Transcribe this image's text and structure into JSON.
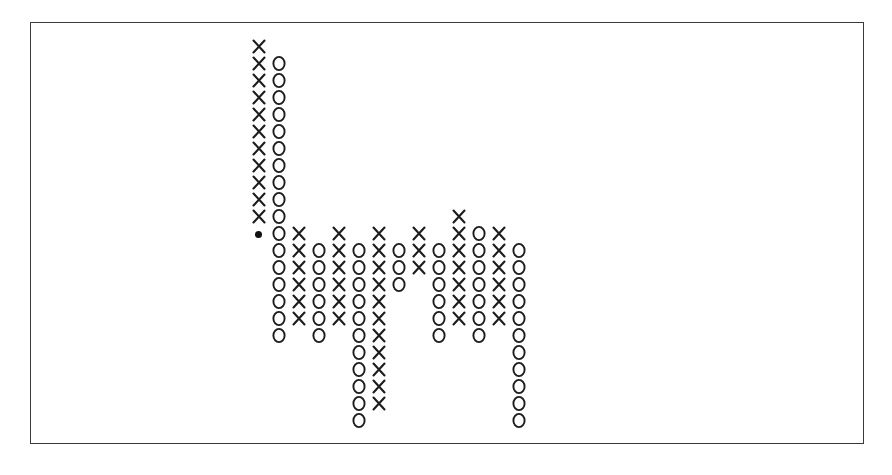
{
  "chart_data": {
    "type": "scatter",
    "title": "",
    "subtitle": "",
    "xlabel": "",
    "ylabel": "",
    "legend": [],
    "grid": false,
    "notation": "point-and-figure",
    "symbols": {
      "up": "X",
      "down": "O",
      "marker": "dot"
    },
    "colors": {
      "symbol": "#1c1c1c",
      "marker": "#111111",
      "frame": "#3a3a3a",
      "background": "#ffffff"
    },
    "geometry": {
      "origin_x": 248,
      "origin_y": 20,
      "col_pitch": 20,
      "row_pitch": 17,
      "columns": 13,
      "rows": 24
    },
    "columns": [
      {
        "index": 0,
        "symbol": "X",
        "top_row": 1,
        "bottom_row": 11,
        "count": 11
      },
      {
        "index": 1,
        "symbol": "O",
        "top_row": 2,
        "bottom_row": 18,
        "count": 17
      },
      {
        "index": 2,
        "symbol": "X",
        "top_row": 12,
        "bottom_row": 17,
        "count": 6
      },
      {
        "index": 3,
        "symbol": "O",
        "top_row": 13,
        "bottom_row": 18,
        "count": 6
      },
      {
        "index": 4,
        "symbol": "X",
        "top_row": 12,
        "bottom_row": 17,
        "count": 6
      },
      {
        "index": 5,
        "symbol": "O",
        "top_row": 13,
        "bottom_row": 23,
        "count": 11
      },
      {
        "index": 6,
        "symbol": "X",
        "top_row": 12,
        "bottom_row": 22,
        "count": 11
      },
      {
        "index": 7,
        "symbol": "O",
        "top_row": 13,
        "bottom_row": 15,
        "count": 3
      },
      {
        "index": 8,
        "symbol": "X",
        "top_row": 12,
        "bottom_row": 14,
        "count": 3
      },
      {
        "index": 9,
        "symbol": "O",
        "top_row": 13,
        "bottom_row": 18,
        "count": 6
      },
      {
        "index": 10,
        "symbol": "X",
        "top_row": 11,
        "bottom_row": 17,
        "count": 7
      },
      {
        "index": 11,
        "symbol": "O",
        "top_row": 12,
        "bottom_row": 18,
        "count": 7
      },
      {
        "index": 12,
        "symbol": "X",
        "top_row": 12,
        "bottom_row": 17,
        "count": 6
      },
      {
        "index": 13,
        "symbol": "O",
        "top_row": 13,
        "bottom_row": 23,
        "count": 11
      }
    ],
    "markers": [
      {
        "label": "dot",
        "column": 0,
        "row": 12,
        "symbol": "●"
      }
    ],
    "cells": [
      {
        "c": 0,
        "r": 1,
        "s": "X"
      },
      {
        "c": 0,
        "r": 2,
        "s": "X"
      },
      {
        "c": 0,
        "r": 3,
        "s": "X"
      },
      {
        "c": 0,
        "r": 4,
        "s": "X"
      },
      {
        "c": 0,
        "r": 5,
        "s": "X"
      },
      {
        "c": 0,
        "r": 6,
        "s": "X"
      },
      {
        "c": 0,
        "r": 7,
        "s": "X"
      },
      {
        "c": 0,
        "r": 8,
        "s": "X"
      },
      {
        "c": 0,
        "r": 9,
        "s": "X"
      },
      {
        "c": 0,
        "r": 10,
        "s": "X"
      },
      {
        "c": 0,
        "r": 11,
        "s": "X"
      },
      {
        "c": 0,
        "r": 12,
        "s": "DOT"
      },
      {
        "c": 1,
        "r": 2,
        "s": "O"
      },
      {
        "c": 1,
        "r": 3,
        "s": "O"
      },
      {
        "c": 1,
        "r": 4,
        "s": "O"
      },
      {
        "c": 1,
        "r": 5,
        "s": "O"
      },
      {
        "c": 1,
        "r": 6,
        "s": "O"
      },
      {
        "c": 1,
        "r": 7,
        "s": "O"
      },
      {
        "c": 1,
        "r": 8,
        "s": "O"
      },
      {
        "c": 1,
        "r": 9,
        "s": "O"
      },
      {
        "c": 1,
        "r": 10,
        "s": "O"
      },
      {
        "c": 1,
        "r": 11,
        "s": "O"
      },
      {
        "c": 1,
        "r": 12,
        "s": "O"
      },
      {
        "c": 1,
        "r": 13,
        "s": "O"
      },
      {
        "c": 1,
        "r": 14,
        "s": "O"
      },
      {
        "c": 1,
        "r": 15,
        "s": "O"
      },
      {
        "c": 1,
        "r": 16,
        "s": "O"
      },
      {
        "c": 1,
        "r": 17,
        "s": "O"
      },
      {
        "c": 1,
        "r": 18,
        "s": "O"
      },
      {
        "c": 2,
        "r": 12,
        "s": "X"
      },
      {
        "c": 2,
        "r": 13,
        "s": "X"
      },
      {
        "c": 2,
        "r": 14,
        "s": "X"
      },
      {
        "c": 2,
        "r": 15,
        "s": "X"
      },
      {
        "c": 2,
        "r": 16,
        "s": "X"
      },
      {
        "c": 2,
        "r": 17,
        "s": "X"
      },
      {
        "c": 3,
        "r": 13,
        "s": "O"
      },
      {
        "c": 3,
        "r": 14,
        "s": "O"
      },
      {
        "c": 3,
        "r": 15,
        "s": "O"
      },
      {
        "c": 3,
        "r": 16,
        "s": "O"
      },
      {
        "c": 3,
        "r": 17,
        "s": "O"
      },
      {
        "c": 3,
        "r": 18,
        "s": "O"
      },
      {
        "c": 4,
        "r": 12,
        "s": "X"
      },
      {
        "c": 4,
        "r": 13,
        "s": "X"
      },
      {
        "c": 4,
        "r": 14,
        "s": "X"
      },
      {
        "c": 4,
        "r": 15,
        "s": "X"
      },
      {
        "c": 4,
        "r": 16,
        "s": "X"
      },
      {
        "c": 4,
        "r": 17,
        "s": "X"
      },
      {
        "c": 5,
        "r": 13,
        "s": "O"
      },
      {
        "c": 5,
        "r": 14,
        "s": "O"
      },
      {
        "c": 5,
        "r": 15,
        "s": "O"
      },
      {
        "c": 5,
        "r": 16,
        "s": "O"
      },
      {
        "c": 5,
        "r": 17,
        "s": "O"
      },
      {
        "c": 5,
        "r": 18,
        "s": "O"
      },
      {
        "c": 5,
        "r": 19,
        "s": "O"
      },
      {
        "c": 5,
        "r": 20,
        "s": "O"
      },
      {
        "c": 5,
        "r": 21,
        "s": "O"
      },
      {
        "c": 5,
        "r": 22,
        "s": "O"
      },
      {
        "c": 5,
        "r": 23,
        "s": "O"
      },
      {
        "c": 6,
        "r": 12,
        "s": "X"
      },
      {
        "c": 6,
        "r": 13,
        "s": "X"
      },
      {
        "c": 6,
        "r": 14,
        "s": "X"
      },
      {
        "c": 6,
        "r": 15,
        "s": "X"
      },
      {
        "c": 6,
        "r": 16,
        "s": "X"
      },
      {
        "c": 6,
        "r": 17,
        "s": "X"
      },
      {
        "c": 6,
        "r": 18,
        "s": "X"
      },
      {
        "c": 6,
        "r": 19,
        "s": "X"
      },
      {
        "c": 6,
        "r": 20,
        "s": "X"
      },
      {
        "c": 6,
        "r": 21,
        "s": "X"
      },
      {
        "c": 6,
        "r": 22,
        "s": "X"
      },
      {
        "c": 7,
        "r": 13,
        "s": "O"
      },
      {
        "c": 7,
        "r": 14,
        "s": "O"
      },
      {
        "c": 7,
        "r": 15,
        "s": "O"
      },
      {
        "c": 8,
        "r": 12,
        "s": "X"
      },
      {
        "c": 8,
        "r": 13,
        "s": "X"
      },
      {
        "c": 8,
        "r": 14,
        "s": "X"
      },
      {
        "c": 9,
        "r": 13,
        "s": "O"
      },
      {
        "c": 9,
        "r": 14,
        "s": "O"
      },
      {
        "c": 9,
        "r": 15,
        "s": "O"
      },
      {
        "c": 9,
        "r": 16,
        "s": "O"
      },
      {
        "c": 9,
        "r": 17,
        "s": "O"
      },
      {
        "c": 9,
        "r": 18,
        "s": "O"
      },
      {
        "c": 10,
        "r": 11,
        "s": "X"
      },
      {
        "c": 10,
        "r": 12,
        "s": "X"
      },
      {
        "c": 10,
        "r": 13,
        "s": "X"
      },
      {
        "c": 10,
        "r": 14,
        "s": "X"
      },
      {
        "c": 10,
        "r": 15,
        "s": "X"
      },
      {
        "c": 10,
        "r": 16,
        "s": "X"
      },
      {
        "c": 10,
        "r": 17,
        "s": "X"
      },
      {
        "c": 11,
        "r": 12,
        "s": "O"
      },
      {
        "c": 11,
        "r": 13,
        "s": "O"
      },
      {
        "c": 11,
        "r": 14,
        "s": "O"
      },
      {
        "c": 11,
        "r": 15,
        "s": "O"
      },
      {
        "c": 11,
        "r": 16,
        "s": "O"
      },
      {
        "c": 11,
        "r": 17,
        "s": "O"
      },
      {
        "c": 11,
        "r": 18,
        "s": "O"
      },
      {
        "c": 12,
        "r": 12,
        "s": "X"
      },
      {
        "c": 12,
        "r": 13,
        "s": "X"
      },
      {
        "c": 12,
        "r": 14,
        "s": "X"
      },
      {
        "c": 12,
        "r": 15,
        "s": "X"
      },
      {
        "c": 12,
        "r": 16,
        "s": "X"
      },
      {
        "c": 12,
        "r": 17,
        "s": "X"
      },
      {
        "c": 13,
        "r": 13,
        "s": "O"
      },
      {
        "c": 13,
        "r": 14,
        "s": "O"
      },
      {
        "c": 13,
        "r": 15,
        "s": "O"
      },
      {
        "c": 13,
        "r": 16,
        "s": "O"
      },
      {
        "c": 13,
        "r": 17,
        "s": "O"
      },
      {
        "c": 13,
        "r": 18,
        "s": "O"
      },
      {
        "c": 13,
        "r": 19,
        "s": "O"
      },
      {
        "c": 13,
        "r": 20,
        "s": "O"
      },
      {
        "c": 13,
        "r": 21,
        "s": "O"
      },
      {
        "c": 13,
        "r": 22,
        "s": "O"
      },
      {
        "c": 13,
        "r": 23,
        "s": "O"
      }
    ]
  }
}
